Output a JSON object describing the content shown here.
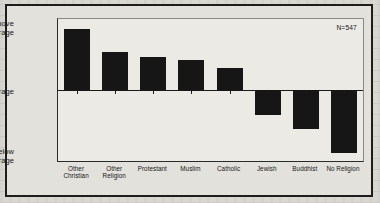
{
  "chart_data": {
    "type": "bar",
    "title": "",
    "xlabel": "",
    "ylabel": "",
    "categories": [
      "Other Christian",
      "Other Religion",
      "Protestant",
      "Muslim",
      "Catholic",
      "Jewish",
      "Buddhist",
      "No Religion"
    ],
    "category_lines": [
      [
        "Other",
        "Christian"
      ],
      [
        "Other",
        "Religion"
      ],
      [
        "Protestant",
        ""
      ],
      [
        "Muslim",
        ""
      ],
      [
        "Catholic",
        ""
      ],
      [
        "Jewish",
        ""
      ],
      [
        "Buddhist",
        ""
      ],
      [
        "No Religion",
        ""
      ]
    ],
    "values": [
      60,
      37,
      33,
      30,
      22,
      -25,
      -38,
      -62
    ],
    "ylim": [
      -70,
      70
    ],
    "ytick_labels": [
      "Above Average",
      "Average",
      "Below Average"
    ],
    "ytick_values": [
      70,
      0,
      -70
    ],
    "grid": false,
    "legend": "none",
    "annotation": "N=547",
    "bar_color": "#161616",
    "axis_color": "#1a1a1a",
    "background_color": "#eceae5"
  },
  "axis": {
    "y_above": "Above\nAverage",
    "y_above_line1": "Above",
    "y_above_line2": "Average",
    "y_average": "Average",
    "y_below_line1": "Below",
    "y_below_line2": "Average"
  },
  "annotation": {
    "sample_size": "N=547"
  }
}
